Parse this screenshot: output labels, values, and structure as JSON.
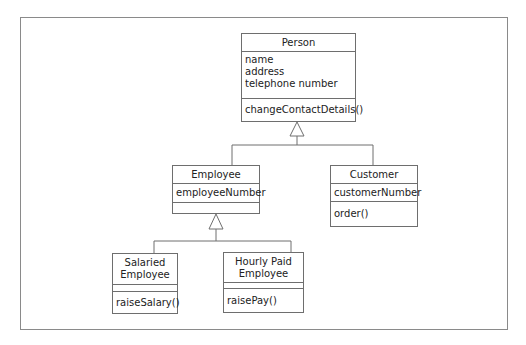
{
  "diagram": {
    "type": "UML class diagram",
    "classes": {
      "person": {
        "name": "Person",
        "attributes": [
          "name",
          "address",
          "telephone number"
        ],
        "methods": [
          "changeContactDetails()"
        ]
      },
      "employee": {
        "name": "Employee",
        "attributes": [
          "employeeNumber"
        ],
        "methods": []
      },
      "customer": {
        "name": "Customer",
        "attributes": [
          "customerNumber"
        ],
        "methods": [
          "order()"
        ]
      },
      "salaried_employee": {
        "name_line1": "Salaried",
        "name_line2": "Employee",
        "attributes": [],
        "methods": [
          "raiseSalary()"
        ]
      },
      "hourly_paid_employee": {
        "name_line1": "Hourly Paid",
        "name_line2": "Employee",
        "attributes": [],
        "methods": [
          "raisePay()"
        ]
      }
    },
    "relationships": [
      {
        "type": "generalization",
        "child": "Employee",
        "parent": "Person"
      },
      {
        "type": "generalization",
        "child": "Customer",
        "parent": "Person"
      },
      {
        "type": "generalization",
        "child": "Salaried Employee",
        "parent": "Employee"
      },
      {
        "type": "generalization",
        "child": "Hourly Paid Employee",
        "parent": "Employee"
      }
    ],
    "colors": {
      "line": "#6e6e6e",
      "frame": "#8a8a8a",
      "background": "#ffffff"
    }
  }
}
